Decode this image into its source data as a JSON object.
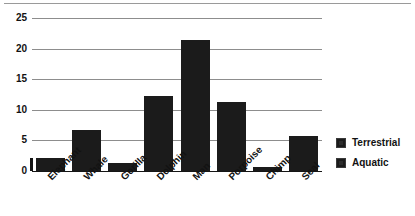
{
  "chart_data": {
    "type": "bar",
    "title": "",
    "subtitle": "",
    "xlabel": "",
    "ylabel": "",
    "categories": [
      "Elephant",
      "Whale",
      "Gorilla",
      "Dolphin",
      "Man",
      "Porpoise",
      "Chimp",
      "Seal"
    ],
    "values": [
      2.1,
      6.7,
      1.3,
      12.3,
      21.4,
      11.3,
      0.6,
      5.7
    ],
    "series": [
      {
        "name": "Values",
        "values": [
          2.1,
          6.7,
          1.3,
          12.3,
          21.4,
          11.3,
          0.6,
          5.7
        ]
      }
    ],
    "point_groups": [
      "Terrestrial",
      "Aquatic",
      "Terrestrial",
      "Aquatic",
      "Terrestrial",
      "Aquatic",
      "Terrestrial",
      "Aquatic"
    ],
    "ylim": [
      0,
      25
    ],
    "ytick_values": [
      0,
      5,
      10,
      15,
      20,
      25
    ],
    "ytick_labels": [
      "0",
      "5",
      "10",
      "15",
      "20",
      "25"
    ],
    "grid": true,
    "grid_axis": "y",
    "legend_position": "right",
    "legend": [
      {
        "label": "Terrestrial",
        "color": "#1b1b1b"
      },
      {
        "label": "Aquatic",
        "color": "#1b1b1b"
      }
    ],
    "bar_color": "#1b1b1b",
    "gridline_color": "#8d8d8d",
    "axis_color": "#151515",
    "background": "#ffffff",
    "xlabel_rotation": -45
  }
}
